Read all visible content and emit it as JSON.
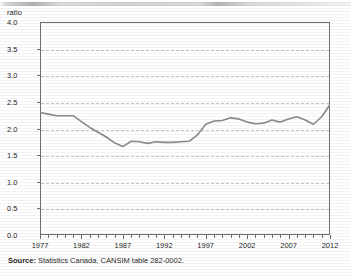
{
  "axis_unit_label": "ratio",
  "source": {
    "label": "Source:",
    "text": " Statistics Canada, CANSIM table 282-0002."
  },
  "chart_data": {
    "type": "line",
    "title": "",
    "xlabel": "",
    "ylabel": "ratio",
    "ylim": [
      0.0,
      4.0
    ],
    "xlim": [
      1977,
      2012
    ],
    "grid": true,
    "legend": false,
    "ytick_labels": [
      "4.0",
      "3.5",
      "3.0",
      "2.5",
      "2.0",
      "1.5",
      "1.0",
      "0.5",
      "0.0"
    ],
    "ytick_values": [
      4.0,
      3.5,
      3.0,
      2.5,
      2.0,
      1.5,
      1.0,
      0.5,
      0.0
    ],
    "xtick_labels": [
      "1977",
      "1982",
      "1987",
      "1992",
      "1997",
      "2002",
      "2007",
      "2012"
    ],
    "xtick_values": [
      1977,
      1982,
      1987,
      1992,
      1997,
      2002,
      2007,
      2012
    ],
    "line_color": "#8a8a8a",
    "x": [
      1977,
      1978,
      1979,
      1980,
      1981,
      1982,
      1983,
      1984,
      1985,
      1986,
      1987,
      1988,
      1989,
      1990,
      1991,
      1992,
      1993,
      1994,
      1995,
      1996,
      1997,
      1998,
      1999,
      2000,
      2001,
      2002,
      2003,
      2004,
      2005,
      2006,
      2007,
      2008,
      2009,
      2010,
      2011,
      2012
    ],
    "values": [
      2.3,
      2.27,
      2.24,
      2.24,
      2.24,
      2.13,
      2.02,
      1.93,
      1.84,
      1.73,
      1.66,
      1.76,
      1.75,
      1.72,
      1.75,
      1.74,
      1.74,
      1.75,
      1.76,
      1.88,
      2.08,
      2.14,
      2.15,
      2.2,
      2.18,
      2.12,
      2.09,
      2.1,
      2.16,
      2.12,
      2.18,
      2.22,
      2.16,
      2.08,
      2.22,
      2.45
    ],
    "series": [
      {
        "name": "ratio",
        "values": [
          2.3,
          2.27,
          2.24,
          2.24,
          2.24,
          2.13,
          2.02,
          1.93,
          1.84,
          1.73,
          1.66,
          1.76,
          1.75,
          1.72,
          1.75,
          1.74,
          1.74,
          1.75,
          1.76,
          1.88,
          2.08,
          2.14,
          2.15,
          2.2,
          2.18,
          2.12,
          2.09,
          2.1,
          2.16,
          2.12,
          2.18,
          2.22,
          2.16,
          2.08,
          2.22,
          2.45
        ]
      }
    ]
  }
}
